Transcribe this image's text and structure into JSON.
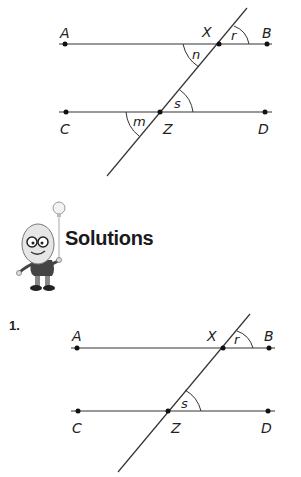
{
  "question_diagram": {
    "points": {
      "A": "A",
      "B": "B",
      "C": "C",
      "D": "D",
      "X": "X",
      "Z": "Z"
    },
    "angles": {
      "n": "n",
      "r": "r",
      "s": "s",
      "m": "m"
    }
  },
  "solutions_header": {
    "title": "Solutions",
    "mascot": "egg-character-with-lightbulb-icon"
  },
  "solution_1": {
    "number": "1.",
    "points": {
      "A": "A",
      "B": "B",
      "C": "C",
      "D": "D",
      "X": "X",
      "Z": "Z"
    },
    "angles": {
      "r": "r",
      "s": "s"
    }
  }
}
